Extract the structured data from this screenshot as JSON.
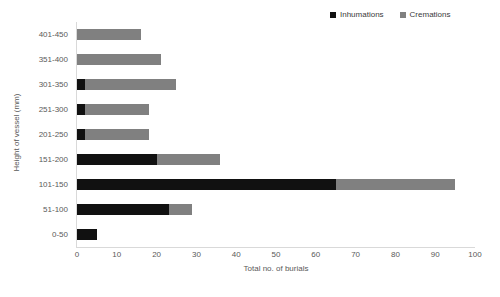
{
  "chart_data": {
    "type": "bar",
    "orientation": "horizontal",
    "stacked": true,
    "title": "",
    "xlabel": "Total no. of burials",
    "ylabel": "Height of vessel (mm)",
    "xlim": [
      0,
      100
    ],
    "xticks": [
      0,
      10,
      20,
      30,
      40,
      50,
      60,
      70,
      80,
      90,
      100
    ],
    "grid": false,
    "legend_position": "top-right",
    "categories": [
      "401-450",
      "351-400",
      "301-350",
      "251-300",
      "201-250",
      "151-200",
      "101-150",
      "51-100",
      "0-50"
    ],
    "series": [
      {
        "name": "Inhumations",
        "color": "#111111",
        "values": [
          0,
          0,
          2,
          2,
          2,
          20,
          65,
          23,
          5
        ]
      },
      {
        "name": "Cremations",
        "color": "#808080",
        "values": [
          16,
          21,
          23,
          16,
          16,
          16,
          30,
          6,
          0
        ]
      }
    ],
    "totals": [
      16,
      21,
      25,
      18,
      18,
      36,
      95,
      29,
      5
    ]
  },
  "legend": {
    "entries": [
      {
        "label": "Inhumations",
        "color": "#111111"
      },
      {
        "label": "Cremations",
        "color": "#808080"
      }
    ]
  }
}
